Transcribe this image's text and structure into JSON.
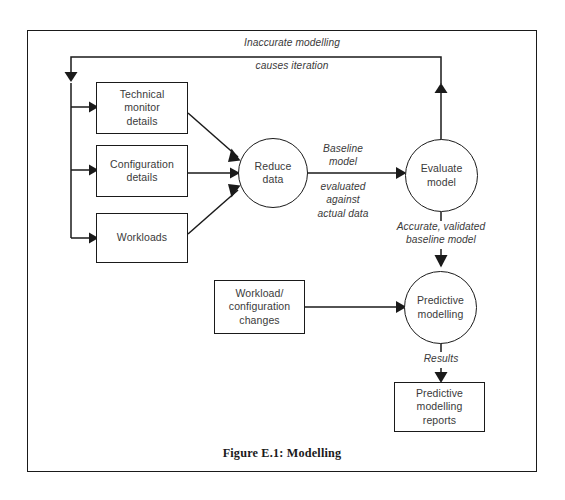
{
  "figure": {
    "caption": "Figure E.1: Modelling",
    "frame_color": "#1a1a1a",
    "line_color": "#1a1a1a",
    "text_color": "#3a3a3a",
    "background": "#ffffff"
  },
  "nodes": {
    "technical_monitor": {
      "line1": "Technical",
      "line2": "monitor",
      "line3": "details"
    },
    "configuration": {
      "line1": "Configuration",
      "line2": "details"
    },
    "workloads": {
      "line1": "Workloads"
    },
    "reduce_data": {
      "line1": "Reduce",
      "line2": "data"
    },
    "evaluate_model": {
      "line1": "Evaluate",
      "line2": "model"
    },
    "workload_changes": {
      "line1": "Workload/",
      "line2": "configuration",
      "line3": "changes"
    },
    "predictive_modelling": {
      "line1": "Predictive",
      "line2": "modelling"
    },
    "predictive_reports": {
      "line1": "Predictive",
      "line2": "modelling",
      "line3": "reports"
    }
  },
  "flow_labels": {
    "feedback_top": {
      "line1": "Inaccurate modelling",
      "line2": "causes iteration"
    },
    "baseline_above": {
      "line1": "Baseline",
      "line2": "model"
    },
    "baseline_below": {
      "line1": "evaluated",
      "line2": "against",
      "line3": "actual data"
    },
    "validated": {
      "line1": "Accurate, validated",
      "line2": "baseline model"
    },
    "results": {
      "line1": "Results"
    }
  }
}
